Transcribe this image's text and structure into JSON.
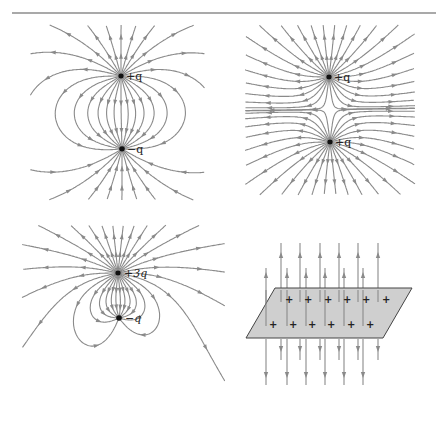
{
  "figure": {
    "panels": [
      {
        "id": "dipole",
        "charges": [
          {
            "label": "+q",
            "x": 121,
            "y": 76,
            "sign": "+"
          },
          {
            "label": "−q",
            "x": 122,
            "y": 149,
            "sign": "-"
          }
        ]
      },
      {
        "id": "like-charges",
        "charges": [
          {
            "label": "+q",
            "x": 329,
            "y": 77,
            "sign": "+"
          },
          {
            "label": "+q",
            "x": 330,
            "y": 142,
            "sign": "+"
          }
        ]
      },
      {
        "id": "unequal-charges",
        "charges": [
          {
            "label": "+3q",
            "x": 118,
            "y": 273,
            "sign": "+"
          },
          {
            "label": "−q",
            "x": 119,
            "y": 318,
            "sign": "-"
          }
        ]
      },
      {
        "id": "charged-plane",
        "plus_symbol": "+",
        "rows": 2,
        "charges_per_row": 6
      }
    ],
    "colors": {
      "field_line": "#8a8a8a",
      "charge": "#111111",
      "plane_fill": "#cfcfcf",
      "rule": "#555555"
    }
  }
}
